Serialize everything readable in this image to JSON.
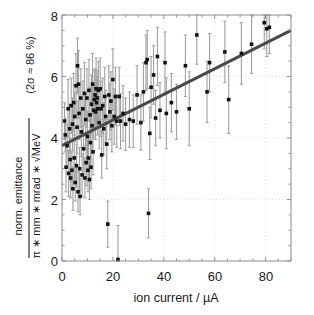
{
  "figure": {
    "background_color": "#ffffff",
    "axis_color": "#8c8c8c",
    "grid_color": "#d9d9d9",
    "marker_color": "#121212",
    "errorbar_color": "#a0a0a0",
    "fit_line_color": "#4a4a4a"
  },
  "labels": {
    "xlabel": "ion current / µA",
    "ylabel_numerator": "norm. emittance",
    "ylabel_denominator": "π ∗ mm ∗ mrad ∗ √MeV",
    "ylabel_note": "(2σ ≈ 86 %)",
    "x_ticks": [
      "0",
      "20",
      "40",
      "60",
      "80"
    ],
    "y_ticks": [
      "0",
      "2",
      "4",
      "6",
      "8"
    ]
  },
  "chart_data": {
    "type": "scatter",
    "title": "",
    "xlabel": "ion current / µA",
    "ylabel": "norm. emittance / (π ∗ mm ∗ mrad ∗ √MeV)  (2σ ≈ 86 %)",
    "xlim": [
      0,
      90
    ],
    "ylim": [
      0,
      8
    ],
    "xticks": [
      0,
      20,
      40,
      60,
      80
    ],
    "yticks": [
      0,
      2,
      4,
      6,
      8
    ],
    "grid": true,
    "legend": "none",
    "errorbars": "vertical (y)",
    "fit_line": {
      "type": "linear",
      "x": [
        0,
        90
      ],
      "y": [
        3.75,
        7.5
      ],
      "intercept": 3.75,
      "slope": 0.0417,
      "color": "#4a4a4a",
      "width": 3
    },
    "points": [
      {
        "x": 1.0,
        "y": 4.55,
        "yerr": 0.6
      },
      {
        "x": 1.3,
        "y": 4.1,
        "yerr": 0.55
      },
      {
        "x": 1.6,
        "y": 3.05,
        "yerr": 0.8
      },
      {
        "x": 2.0,
        "y": 3.75,
        "yerr": 0.7
      },
      {
        "x": 2.4,
        "y": 4.95,
        "yerr": 0.95
      },
      {
        "x": 2.6,
        "y": 2.85,
        "yerr": 0.75
      },
      {
        "x": 3.0,
        "y": 4.3,
        "yerr": 0.8
      },
      {
        "x": 3.2,
        "y": 3.3,
        "yerr": 0.7
      },
      {
        "x": 3.4,
        "y": 2.7,
        "yerr": 0.65
      },
      {
        "x": 3.6,
        "y": 5.05,
        "yerr": 0.9
      },
      {
        "x": 3.9,
        "y": 2.95,
        "yerr": 0.6
      },
      {
        "x": 4.1,
        "y": 4.45,
        "yerr": 0.85
      },
      {
        "x": 4.3,
        "y": 2.35,
        "yerr": 0.7
      },
      {
        "x": 4.6,
        "y": 5.15,
        "yerr": 0.95
      },
      {
        "x": 4.8,
        "y": 3.35,
        "yerr": 0.75
      },
      {
        "x": 5.0,
        "y": 4.7,
        "yerr": 0.8
      },
      {
        "x": 5.2,
        "y": 2.55,
        "yerr": 0.6
      },
      {
        "x": 5.5,
        "y": 5.7,
        "yerr": 1.05
      },
      {
        "x": 5.7,
        "y": 3.1,
        "yerr": 0.7
      },
      {
        "x": 5.9,
        "y": 4.35,
        "yerr": 0.85
      },
      {
        "x": 6.1,
        "y": 6.35,
        "yerr": 0.9
      },
      {
        "x": 6.3,
        "y": 2.25,
        "yerr": 0.65
      },
      {
        "x": 6.5,
        "y": 5.75,
        "yerr": 1.1
      },
      {
        "x": 6.7,
        "y": 4.8,
        "yerr": 0.85
      },
      {
        "x": 6.9,
        "y": 3.0,
        "yerr": 0.7
      },
      {
        "x": 7.1,
        "y": 2.1,
        "yerr": 0.6
      },
      {
        "x": 7.4,
        "y": 5.3,
        "yerr": 0.95
      },
      {
        "x": 7.6,
        "y": 4.2,
        "yerr": 0.8
      },
      {
        "x": 7.9,
        "y": 2.8,
        "yerr": 0.7
      },
      {
        "x": 8.2,
        "y": 4.95,
        "yerr": 0.9
      },
      {
        "x": 8.5,
        "y": 3.65,
        "yerr": 0.75
      },
      {
        "x": 8.8,
        "y": 5.45,
        "yerr": 1.0
      },
      {
        "x": 9.0,
        "y": 2.7,
        "yerr": 0.65
      },
      {
        "x": 9.3,
        "y": 4.6,
        "yerr": 0.85
      },
      {
        "x": 9.5,
        "y": 3.2,
        "yerr": 0.75
      },
      {
        "x": 9.8,
        "y": 5.3,
        "yerr": 0.95
      },
      {
        "x": 10.0,
        "y": 4.05,
        "yerr": 0.8
      },
      {
        "x": 10.2,
        "y": 2.95,
        "yerr": 0.7
      },
      {
        "x": 10.4,
        "y": 3.35,
        "yerr": 0.75
      },
      {
        "x": 10.6,
        "y": 5.55,
        "yerr": 1.0
      },
      {
        "x": 10.8,
        "y": 2.65,
        "yerr": 0.65
      },
      {
        "x": 11.0,
        "y": 4.75,
        "yerr": 0.9
      },
      {
        "x": 11.2,
        "y": 3.85,
        "yerr": 0.8
      },
      {
        "x": 11.4,
        "y": 3.05,
        "yerr": 0.7
      },
      {
        "x": 11.6,
        "y": 5.1,
        "yerr": 0.95
      },
      {
        "x": 11.8,
        "y": 4.4,
        "yerr": 0.85
      },
      {
        "x": 12.0,
        "y": 5.75,
        "yerr": 1.0
      },
      {
        "x": 12.2,
        "y": 3.55,
        "yerr": 0.75
      },
      {
        "x": 12.5,
        "y": 4.9,
        "yerr": 0.9
      },
      {
        "x": 12.7,
        "y": 5.25,
        "yerr": 0.95
      },
      {
        "x": 13.0,
        "y": 5.4,
        "yerr": 0.85
      },
      {
        "x": 13.2,
        "y": 4.85,
        "yerr": 0.9
      },
      {
        "x": 13.4,
        "y": 5.6,
        "yerr": 1.0
      },
      {
        "x": 13.6,
        "y": 5.15,
        "yerr": 0.85
      },
      {
        "x": 13.8,
        "y": 5.3,
        "yerr": 0.9
      },
      {
        "x": 14.0,
        "y": 4.95,
        "yerr": 0.85
      },
      {
        "x": 14.3,
        "y": 5.55,
        "yerr": 0.95
      },
      {
        "x": 14.6,
        "y": 4.5,
        "yerr": 0.85
      },
      {
        "x": 15.0,
        "y": 5.6,
        "yerr": 1.0
      },
      {
        "x": 15.3,
        "y": 4.95,
        "yerr": 0.9
      },
      {
        "x": 15.6,
        "y": 3.45,
        "yerr": 0.75
      },
      {
        "x": 16.0,
        "y": 5.05,
        "yerr": 0.9
      },
      {
        "x": 16.4,
        "y": 4.3,
        "yerr": 0.85
      },
      {
        "x": 16.8,
        "y": 5.35,
        "yerr": 0.95
      },
      {
        "x": 17.2,
        "y": 4.7,
        "yerr": 0.85
      },
      {
        "x": 17.6,
        "y": 3.8,
        "yerr": 0.8
      },
      {
        "x": 18.0,
        "y": 1.2,
        "yerr": 0.75
      },
      {
        "x": 18.4,
        "y": 5.4,
        "yerr": 0.95
      },
      {
        "x": 18.8,
        "y": 4.85,
        "yerr": 0.9
      },
      {
        "x": 19.2,
        "y": 5.2,
        "yerr": 0.95
      },
      {
        "x": 19.6,
        "y": 4.4,
        "yerr": 0.85
      },
      {
        "x": 20.0,
        "y": 5.9,
        "yerr": 1.0
      },
      {
        "x": 20.5,
        "y": 4.7,
        "yerr": 0.9
      },
      {
        "x": 21.0,
        "y": 5.35,
        "yerr": 0.95
      },
      {
        "x": 21.5,
        "y": 4.55,
        "yerr": 0.85
      },
      {
        "x": 22.0,
        "y": 0.05,
        "yerr": 1.1
      },
      {
        "x": 22.5,
        "y": 5.35,
        "yerr": 0.95
      },
      {
        "x": 23.0,
        "y": 4.55,
        "yerr": 0.9
      },
      {
        "x": 24.0,
        "y": 4.8,
        "yerr": 0.9
      },
      {
        "x": 25.0,
        "y": 4.45,
        "yerr": 0.85
      },
      {
        "x": 26.5,
        "y": 4.6,
        "yerr": 0.9
      },
      {
        "x": 28.0,
        "y": 4.55,
        "yerr": 0.85
      },
      {
        "x": 29.5,
        "y": 5.4,
        "yerr": 0.95
      },
      {
        "x": 31.0,
        "y": 4.5,
        "yerr": 0.9
      },
      {
        "x": 32.0,
        "y": 5.5,
        "yerr": 0.95
      },
      {
        "x": 33.0,
        "y": 6.45,
        "yerr": 0.9
      },
      {
        "x": 33.5,
        "y": 6.55,
        "yerr": 0.95
      },
      {
        "x": 34.0,
        "y": 1.55,
        "yerr": 0.8
      },
      {
        "x": 34.5,
        "y": 4.15,
        "yerr": 0.85
      },
      {
        "x": 35.0,
        "y": 5.65,
        "yerr": 1.0
      },
      {
        "x": 36.0,
        "y": 6.05,
        "yerr": 0.95
      },
      {
        "x": 36.8,
        "y": 4.65,
        "yerr": 0.9
      },
      {
        "x": 37.5,
        "y": 6.65,
        "yerr": 0.95
      },
      {
        "x": 38.5,
        "y": 4.9,
        "yerr": 0.9
      },
      {
        "x": 40.5,
        "y": 6.45,
        "yerr": 1.0
      },
      {
        "x": 41.0,
        "y": 4.8,
        "yerr": 1.15
      },
      {
        "x": 43.0,
        "y": 5.15,
        "yerr": 0.95
      },
      {
        "x": 45.0,
        "y": 4.85,
        "yerr": 0.9
      },
      {
        "x": 48.5,
        "y": 6.35,
        "yerr": 1.0
      },
      {
        "x": 50.0,
        "y": 4.95,
        "yerr": 1.2
      },
      {
        "x": 53.0,
        "y": 7.35,
        "yerr": 0.95
      },
      {
        "x": 57.0,
        "y": 5.5,
        "yerr": 1.0
      },
      {
        "x": 58.0,
        "y": 6.45,
        "yerr": 0.95
      },
      {
        "x": 64.0,
        "y": 6.8,
        "yerr": 1.0
      },
      {
        "x": 65.5,
        "y": 5.25,
        "yerr": 1.1
      },
      {
        "x": 70.5,
        "y": 6.75,
        "yerr": 1.0
      },
      {
        "x": 74.5,
        "y": 7.05,
        "yerr": 0.95
      },
      {
        "x": 79.5,
        "y": 7.75,
        "yerr": 0.85
      },
      {
        "x": 80.5,
        "y": 7.55,
        "yerr": 0.9
      },
      {
        "x": 81.5,
        "y": 7.6,
        "yerr": 0.85
      }
    ]
  }
}
